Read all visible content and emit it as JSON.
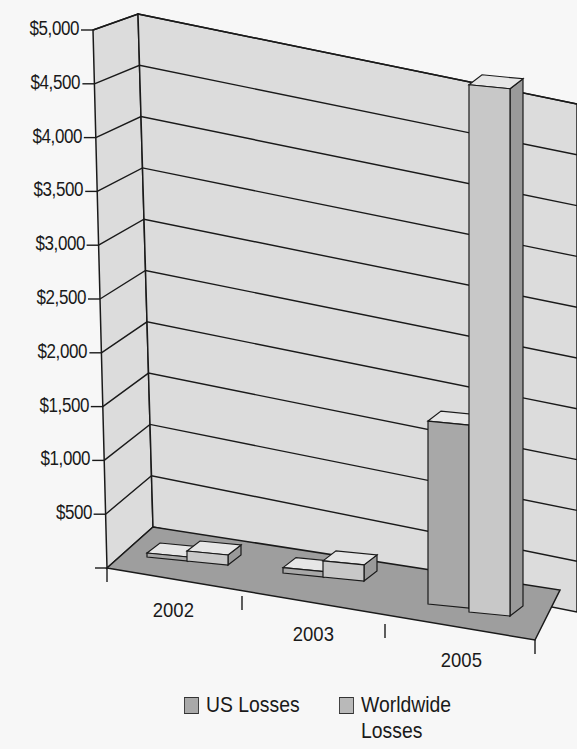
{
  "chart_data": {
    "type": "bar",
    "style": "3d-clustered-column",
    "title": "",
    "xlabel": "",
    "ylabel": "",
    "categories": [
      "2002",
      "2003",
      "2005"
    ],
    "series": [
      {
        "name": "US Losses",
        "values": [
          10,
          50,
          1700
        ],
        "color": "#a8a8a8"
      },
      {
        "name": "Worldwide Losses",
        "values": [
          20,
          150,
          4900
        ],
        "color": "#c8c8c8"
      }
    ],
    "ylim": [
      0,
      5000
    ],
    "y_ticks": [
      "$500",
      "$1,000",
      "$1,500",
      "$2,000",
      "$2,500",
      "$3,000",
      "$3,500",
      "$4,000",
      "$4,500",
      "$5,000"
    ],
    "grid": true,
    "legend_position": "bottom"
  },
  "legend": {
    "items": [
      {
        "label_line1": "US Losses",
        "label_line2": ""
      },
      {
        "label_line1": "Worldwide",
        "label_line2": "Losses"
      }
    ]
  },
  "colors": {
    "wall": "#dcdcdc",
    "floor": "#9e9e9e",
    "line": "#1a1a1a"
  }
}
